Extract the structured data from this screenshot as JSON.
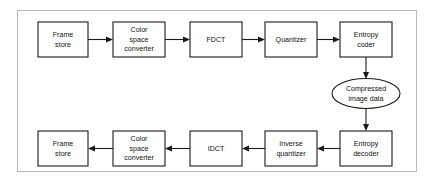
{
  "diagram": {
    "type": "flowchart",
    "colors": {
      "background": "#ffffff",
      "stroke": "#1a1a1a",
      "frame": "#b9b9b9",
      "text": "#111111"
    },
    "encoder_row": {
      "direction": "left-to-right",
      "nodes": [
        {
          "id": "frame-store-in",
          "shape": "rect",
          "line1": "Frame",
          "line2": "store"
        },
        {
          "id": "color-space-converter-in",
          "shape": "rect",
          "line1": "Color",
          "line2": "space",
          "line3": "converter"
        },
        {
          "id": "fdct",
          "shape": "rect",
          "line1": "FDCT"
        },
        {
          "id": "quantizer",
          "shape": "rect",
          "line1": "Quantizer"
        },
        {
          "id": "entropy-coder",
          "shape": "rect",
          "line1": "Entropy",
          "line2": "coder"
        }
      ]
    },
    "storage": {
      "id": "compressed-image-data",
      "shape": "ellipse",
      "line1": "Compressed",
      "line2": "image data"
    },
    "decoder_row": {
      "direction": "right-to-left",
      "nodes": [
        {
          "id": "entropy-decoder",
          "shape": "rect",
          "line1": "Entropy",
          "line2": "decoder"
        },
        {
          "id": "inverse-quantizer",
          "shape": "rect",
          "line1": "Inverse",
          "line2": "quantizer"
        },
        {
          "id": "idct",
          "shape": "rect",
          "line1": "IDCT"
        },
        {
          "id": "color-space-converter-out",
          "shape": "rect",
          "line1": "Color",
          "line2": "space",
          "line3": "converter"
        },
        {
          "id": "frame-store-out",
          "shape": "rect",
          "line1": "Frame",
          "line2": "store"
        }
      ]
    },
    "connections": [
      {
        "from": "frame-store-in",
        "to": "color-space-converter-in",
        "orientation": "horizontal-right"
      },
      {
        "from": "color-space-converter-in",
        "to": "fdct",
        "orientation": "horizontal-right"
      },
      {
        "from": "fdct",
        "to": "quantizer",
        "orientation": "horizontal-right"
      },
      {
        "from": "quantizer",
        "to": "entropy-coder",
        "orientation": "horizontal-right"
      },
      {
        "from": "entropy-coder",
        "to": "compressed-image-data",
        "orientation": "vertical-down"
      },
      {
        "from": "compressed-image-data",
        "to": "entropy-decoder",
        "orientation": "vertical-down"
      },
      {
        "from": "entropy-decoder",
        "to": "inverse-quantizer",
        "orientation": "horizontal-left"
      },
      {
        "from": "inverse-quantizer",
        "to": "idct",
        "orientation": "horizontal-left"
      },
      {
        "from": "idct",
        "to": "color-space-converter-out",
        "orientation": "horizontal-left"
      },
      {
        "from": "color-space-converter-out",
        "to": "frame-store-out",
        "orientation": "horizontal-left"
      }
    ]
  }
}
